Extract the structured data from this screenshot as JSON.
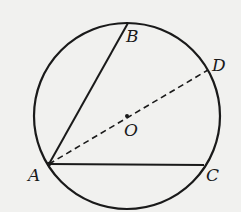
{
  "diagram": {
    "type": "geometry-circle-inscribed-angle",
    "circle": {
      "center": "O",
      "cx": 127,
      "cy": 116,
      "r": 93
    },
    "points": {
      "A": {
        "label": "A",
        "x": 49,
        "y": 164
      },
      "B": {
        "label": "B",
        "x": 128,
        "y": 23
      },
      "C": {
        "label": "C",
        "x": 204,
        "y": 165
      },
      "D": {
        "label": "D",
        "x": 208,
        "y": 70
      },
      "O": {
        "label": "O",
        "x": 127,
        "y": 116
      }
    },
    "segments": [
      {
        "from": "A",
        "to": "B",
        "style": "solid"
      },
      {
        "from": "A",
        "to": "C",
        "style": "solid"
      },
      {
        "from": "A",
        "to": "D",
        "style": "dashed",
        "through": "O"
      }
    ],
    "colors": {
      "ink": "#1a1a1a",
      "background": "#f1f1ef"
    }
  }
}
